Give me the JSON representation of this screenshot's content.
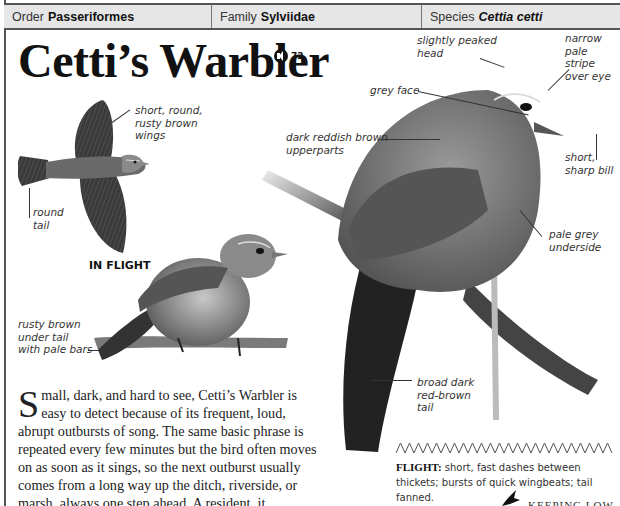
{
  "header": {
    "order_label": "Order",
    "order_value": "Passeriformes",
    "family_label": "Family",
    "family_value": "Sylviidae",
    "species_label": "Species",
    "species_value": "Cettia cetti"
  },
  "title": "Cetti’s Warbler",
  "audio": {
    "icon": "speaker-icon",
    "track": "72"
  },
  "flight_illustration": {
    "caption": "IN FLIGHT",
    "labels": {
      "wings": "short, round,\nrusty brown\nwings",
      "tail": "round\ntail"
    }
  },
  "perched_small": {
    "labels": {
      "under_tail": "rusty brown\nunder tail\nwith pale bars"
    }
  },
  "perched_large": {
    "labels": {
      "head": "slightly peaked\nhead",
      "stripe": "narrow\npale stripe\nover eye",
      "face": "grey face",
      "upperparts": "dark reddish brown\nupperparts",
      "bill": "short,\nsharp bill",
      "underside": "pale grey\nunderside",
      "tail": "broad dark\nred-brown\ntail"
    }
  },
  "description": {
    "dropcap": "S",
    "text": "mall, dark, and hard to see, Cetti’s Warbler is easy to detect because of its frequent, loud, abrupt outbursts of song. The same basic phrase is repeated every few minutes but the bird often moves on as soon as it sings, so the next outburst usually comes from a long way up the ditch, riverside, or marsh, always one step ahead. A resident, it"
  },
  "flight": {
    "pattern_icon": "zigzag-flight-pattern-icon",
    "label": "FLIGHT:",
    "text": " short, fast dashes between thickets; bursts of quick wingbeats; tail fanned."
  },
  "sidebar_heading": "KEEPING LOW"
}
